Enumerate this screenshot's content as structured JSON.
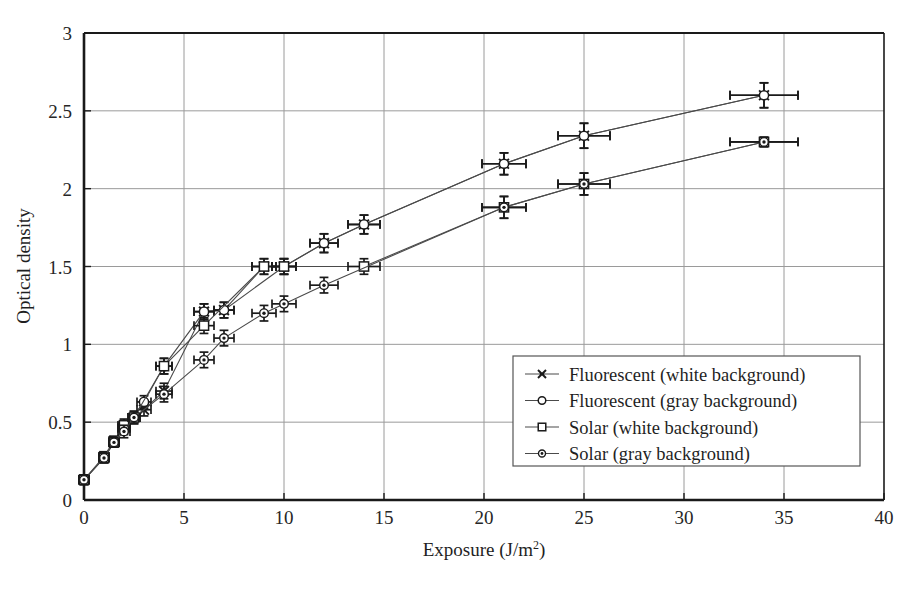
{
  "chart_data": {
    "type": "scatter",
    "title": "",
    "xlabel": "Exposure (J/m2)",
    "xlabel_base": "Exposure (J/m",
    "xlabel_sup": "2",
    "xlabel_tail": ")",
    "ylabel": "Optical density",
    "xlim": [
      0,
      40
    ],
    "ylim": [
      0,
      3
    ],
    "xticks": [
      0,
      5,
      10,
      15,
      20,
      25,
      30,
      35,
      40
    ],
    "xtick_labels": [
      "0",
      "5",
      "10",
      "15",
      "20",
      "25",
      "30",
      "35",
      "40"
    ],
    "yticks": [
      0,
      0.5,
      1,
      1.5,
      2,
      2.5,
      3
    ],
    "ytick_labels": [
      "0",
      "0.5",
      "1",
      "1.5",
      "2",
      "2.5",
      "3"
    ],
    "grid": "both",
    "legend_position": "center-right-inside",
    "error_bars": "x and y on every point",
    "series": [
      {
        "name": "Fluorescent (white background)",
        "marker": "star-x",
        "color": "#1a1a1a",
        "points": [
          {
            "x": 0,
            "y": 0.13,
            "xerr": 0.15,
            "yerr": 0.03
          },
          {
            "x": 1,
            "y": 0.28,
            "xerr": 0.2,
            "yerr": 0.03
          },
          {
            "x": 1.5,
            "y": 0.38,
            "xerr": 0.25,
            "yerr": 0.03
          },
          {
            "x": 2,
            "y": 0.47,
            "xerr": 0.3,
            "yerr": 0.04
          },
          {
            "x": 3,
            "y": 0.58,
            "xerr": 0.35,
            "yerr": 0.04
          },
          {
            "x": 4,
            "y": 0.7,
            "xerr": 0.4,
            "yerr": 0.05
          },
          {
            "x": 6,
            "y": 1.21,
            "xerr": 0.5,
            "yerr": 0.05
          },
          {
            "x": 7,
            "y": 1.22,
            "xerr": 0.5,
            "yerr": 0.05
          },
          {
            "x": 9,
            "y": 1.5,
            "xerr": 0.6,
            "yerr": 0.05
          },
          {
            "x": 10,
            "y": 1.5,
            "xerr": 0.6,
            "yerr": 0.05
          },
          {
            "x": 12,
            "y": 1.65,
            "xerr": 0.7,
            "yerr": 0.06
          },
          {
            "x": 14,
            "y": 1.77,
            "xerr": 0.8,
            "yerr": 0.06
          },
          {
            "x": 21,
            "y": 2.16,
            "xerr": 1.1,
            "yerr": 0.07
          },
          {
            "x": 25,
            "y": 2.34,
            "xerr": 1.3,
            "yerr": 0.08
          },
          {
            "x": 34,
            "y": 2.6,
            "xerr": 1.7,
            "yerr": 0.08
          }
        ]
      },
      {
        "name": "Fluorescent (gray background)",
        "marker": "open-circle",
        "color": "#1a1a1a",
        "points": [
          {
            "x": 0,
            "y": 0.13,
            "xerr": 0.15,
            "yerr": 0.03
          },
          {
            "x": 1,
            "y": 0.27,
            "xerr": 0.2,
            "yerr": 0.03
          },
          {
            "x": 1.5,
            "y": 0.37,
            "xerr": 0.25,
            "yerr": 0.03
          },
          {
            "x": 2,
            "y": 0.46,
            "xerr": 0.3,
            "yerr": 0.04
          },
          {
            "x": 3,
            "y": 0.63,
            "xerr": 0.35,
            "yerr": 0.04
          },
          {
            "x": 4,
            "y": 0.86,
            "xerr": 0.4,
            "yerr": 0.05
          },
          {
            "x": 6,
            "y": 1.21,
            "xerr": 0.5,
            "yerr": 0.05
          },
          {
            "x": 7,
            "y": 1.22,
            "xerr": 0.5,
            "yerr": 0.05
          },
          {
            "x": 10,
            "y": 1.5,
            "xerr": 0.6,
            "yerr": 0.05
          },
          {
            "x": 12,
            "y": 1.65,
            "xerr": 0.7,
            "yerr": 0.06
          },
          {
            "x": 14,
            "y": 1.77,
            "xerr": 0.8,
            "yerr": 0.06
          },
          {
            "x": 21,
            "y": 2.16,
            "xerr": 1.1,
            "yerr": 0.07
          },
          {
            "x": 25,
            "y": 2.34,
            "xerr": 1.3,
            "yerr": 0.08
          },
          {
            "x": 34,
            "y": 2.6,
            "xerr": 1.7,
            "yerr": 0.08
          }
        ]
      },
      {
        "name": "Solar (white background)",
        "marker": "open-square",
        "color": "#1a1a1a",
        "points": [
          {
            "x": 0,
            "y": 0.13,
            "xerr": 0.15,
            "yerr": 0.03
          },
          {
            "x": 1,
            "y": 0.27,
            "xerr": 0.2,
            "yerr": 0.03
          },
          {
            "x": 1.5,
            "y": 0.37,
            "xerr": 0.25,
            "yerr": 0.03
          },
          {
            "x": 2,
            "y": 0.48,
            "xerr": 0.3,
            "yerr": 0.04
          },
          {
            "x": 2.5,
            "y": 0.53,
            "xerr": 0.3,
            "yerr": 0.04
          },
          {
            "x": 4,
            "y": 0.86,
            "xerr": 0.4,
            "yerr": 0.05
          },
          {
            "x": 6,
            "y": 1.12,
            "xerr": 0.5,
            "yerr": 0.05
          },
          {
            "x": 9,
            "y": 1.5,
            "xerr": 0.6,
            "yerr": 0.05
          },
          {
            "x": 10,
            "y": 1.5,
            "xerr": 0.6,
            "yerr": 0.05
          },
          {
            "x": 14,
            "y": 1.5,
            "xerr": 0.8,
            "yerr": 0.05
          },
          {
            "x": 21,
            "y": 1.88,
            "xerr": 1.1,
            "yerr": 0.07
          },
          {
            "x": 25,
            "y": 2.03,
            "xerr": 1.3,
            "yerr": 0.07
          },
          {
            "x": 34,
            "y": 2.3,
            "xerr": 1.7,
            "yerr": 0.03
          }
        ]
      },
      {
        "name": "Solar (gray background)",
        "marker": "dot-circle",
        "color": "#1a1a1a",
        "points": [
          {
            "x": 0,
            "y": 0.13,
            "xerr": 0.15,
            "yerr": 0.03
          },
          {
            "x": 1,
            "y": 0.27,
            "xerr": 0.2,
            "yerr": 0.03
          },
          {
            "x": 1.5,
            "y": 0.37,
            "xerr": 0.25,
            "yerr": 0.03
          },
          {
            "x": 2,
            "y": 0.44,
            "xerr": 0.3,
            "yerr": 0.04
          },
          {
            "x": 2.5,
            "y": 0.53,
            "xerr": 0.3,
            "yerr": 0.04
          },
          {
            "x": 4,
            "y": 0.68,
            "xerr": 0.4,
            "yerr": 0.05
          },
          {
            "x": 6,
            "y": 0.9,
            "xerr": 0.5,
            "yerr": 0.05
          },
          {
            "x": 7,
            "y": 1.04,
            "xerr": 0.5,
            "yerr": 0.05
          },
          {
            "x": 9,
            "y": 1.2,
            "xerr": 0.6,
            "yerr": 0.05
          },
          {
            "x": 10,
            "y": 1.26,
            "xerr": 0.6,
            "yerr": 0.05
          },
          {
            "x": 12,
            "y": 1.38,
            "xerr": 0.7,
            "yerr": 0.05
          },
          {
            "x": 21,
            "y": 1.88,
            "xerr": 1.1,
            "yerr": 0.07
          },
          {
            "x": 25,
            "y": 2.03,
            "xerr": 1.3,
            "yerr": 0.07
          },
          {
            "x": 34,
            "y": 2.3,
            "xerr": 1.7,
            "yerr": 0.03
          }
        ]
      }
    ]
  },
  "legend": {
    "entries": [
      {
        "label": "Fluorescent (white background)",
        "marker": "star-x"
      },
      {
        "label": "Fluorescent (gray background)",
        "marker": "open-circle"
      },
      {
        "label": "Solar (white background)",
        "marker": "open-square"
      },
      {
        "label": "Solar (gray background)",
        "marker": "dot-circle"
      }
    ]
  }
}
